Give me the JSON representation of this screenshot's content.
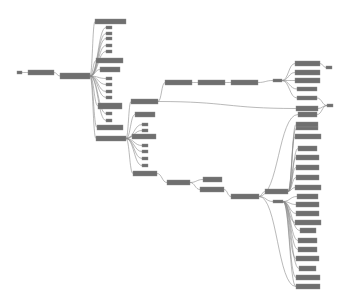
{
  "diagram": {
    "type": "tree-graph",
    "background": "#ffffff",
    "node_color": "#6f6f6f",
    "edge_color": "#8a8a8a",
    "nodes": [
      {
        "id": "n0",
        "x": 17,
        "y": 71,
        "w": 5,
        "h": 3,
        "label": ""
      },
      {
        "id": "n1",
        "x": 28,
        "y": 70,
        "w": 26,
        "h": 5,
        "label": ""
      },
      {
        "id": "n2",
        "x": 60,
        "y": 73,
        "w": 30,
        "h": 6,
        "label": ""
      },
      {
        "id": "a1",
        "x": 95,
        "y": 19,
        "w": 31,
        "h": 5,
        "label": ""
      },
      {
        "id": "a2",
        "x": 106,
        "y": 26,
        "w": 6,
        "h": 3,
        "label": ""
      },
      {
        "id": "a3",
        "x": 106,
        "y": 32,
        "w": 6,
        "h": 3,
        "label": ""
      },
      {
        "id": "a4",
        "x": 106,
        "y": 37,
        "w": 6,
        "h": 3,
        "label": ""
      },
      {
        "id": "a5",
        "x": 106,
        "y": 44,
        "w": 6,
        "h": 3,
        "label": ""
      },
      {
        "id": "a6",
        "x": 106,
        "y": 50,
        "w": 6,
        "h": 3,
        "label": ""
      },
      {
        "id": "a7",
        "x": 96,
        "y": 58,
        "w": 27,
        "h": 5,
        "label": ""
      },
      {
        "id": "a8",
        "x": 100,
        "y": 67,
        "w": 20,
        "h": 5,
        "label": ""
      },
      {
        "id": "a9",
        "x": 106,
        "y": 77,
        "w": 6,
        "h": 3,
        "label": ""
      },
      {
        "id": "a10",
        "x": 106,
        "y": 83,
        "w": 6,
        "h": 3,
        "label": ""
      },
      {
        "id": "a11",
        "x": 106,
        "y": 90,
        "w": 6,
        "h": 3,
        "label": ""
      },
      {
        "id": "a12",
        "x": 106,
        "y": 96,
        "w": 6,
        "h": 3,
        "label": ""
      },
      {
        "id": "a13",
        "x": 98,
        "y": 103,
        "w": 24,
        "h": 6,
        "label": ""
      },
      {
        "id": "a14",
        "x": 106,
        "y": 112,
        "w": 6,
        "h": 3,
        "label": ""
      },
      {
        "id": "a15",
        "x": 106,
        "y": 119,
        "w": 6,
        "h": 3,
        "label": ""
      },
      {
        "id": "a16",
        "x": 97,
        "y": 125,
        "w": 26,
        "h": 5,
        "label": ""
      },
      {
        "id": "h2",
        "x": 96,
        "y": 136,
        "w": 30,
        "h": 5,
        "label": ""
      },
      {
        "id": "b1",
        "x": 131,
        "y": 99,
        "w": 27,
        "h": 5,
        "label": ""
      },
      {
        "id": "b2",
        "x": 135,
        "y": 112,
        "w": 20,
        "h": 5,
        "label": ""
      },
      {
        "id": "b3",
        "x": 142,
        "y": 123,
        "w": 6,
        "h": 3,
        "label": ""
      },
      {
        "id": "b4",
        "x": 142,
        "y": 129,
        "w": 6,
        "h": 3,
        "label": ""
      },
      {
        "id": "b5",
        "x": 132,
        "y": 134,
        "w": 24,
        "h": 5,
        "label": ""
      },
      {
        "id": "b6",
        "x": 142,
        "y": 144,
        "w": 6,
        "h": 3,
        "label": ""
      },
      {
        "id": "b7",
        "x": 142,
        "y": 150,
        "w": 6,
        "h": 3,
        "label": ""
      },
      {
        "id": "b8",
        "x": 142,
        "y": 157,
        "w": 6,
        "h": 3,
        "label": ""
      },
      {
        "id": "b9",
        "x": 142,
        "y": 164,
        "w": 6,
        "h": 3,
        "label": ""
      },
      {
        "id": "b10",
        "x": 133,
        "y": 171,
        "w": 24,
        "h": 5,
        "label": ""
      },
      {
        "id": "c1",
        "x": 165,
        "y": 80,
        "w": 27,
        "h": 5,
        "label": ""
      },
      {
        "id": "c2",
        "x": 198,
        "y": 80,
        "w": 27,
        "h": 5,
        "label": ""
      },
      {
        "id": "c3",
        "x": 231,
        "y": 80,
        "w": 27,
        "h": 5,
        "label": ""
      },
      {
        "id": "c4",
        "x": 273,
        "y": 79,
        "w": 9,
        "h": 3,
        "label": ""
      },
      {
        "id": "d1",
        "x": 167,
        "y": 180,
        "w": 23,
        "h": 5,
        "label": ""
      },
      {
        "id": "d2",
        "x": 203,
        "y": 177,
        "w": 19,
        "h": 5,
        "label": ""
      },
      {
        "id": "d3",
        "x": 200,
        "y": 187,
        "w": 24,
        "h": 5,
        "label": ""
      },
      {
        "id": "d4",
        "x": 231,
        "y": 194,
        "w": 28,
        "h": 5,
        "label": ""
      },
      {
        "id": "h3",
        "x": 265,
        "y": 189,
        "w": 23,
        "h": 5,
        "label": ""
      },
      {
        "id": "h3s",
        "x": 273,
        "y": 200,
        "w": 10,
        "h": 3,
        "label": ""
      },
      {
        "id": "r1",
        "x": 295,
        "y": 61,
        "w": 25,
        "h": 5,
        "label": ""
      },
      {
        "id": "r2",
        "x": 295,
        "y": 70,
        "w": 25,
        "h": 5,
        "label": ""
      },
      {
        "id": "r3",
        "x": 295,
        "y": 78,
        "w": 25,
        "h": 5,
        "label": ""
      },
      {
        "id": "r4",
        "x": 297,
        "y": 87,
        "w": 20,
        "h": 4,
        "label": ""
      },
      {
        "id": "r5",
        "x": 297,
        "y": 96,
        "w": 20,
        "h": 4,
        "label": ""
      },
      {
        "id": "r6",
        "x": 296,
        "y": 106,
        "w": 22,
        "h": 5,
        "label": ""
      },
      {
        "id": "r7",
        "x": 298,
        "y": 112,
        "w": 19,
        "h": 5,
        "label": ""
      },
      {
        "id": "r8",
        "x": 296,
        "y": 122,
        "w": 22,
        "h": 5,
        "label": ""
      },
      {
        "id": "r9",
        "x": 296,
        "y": 127,
        "w": 22,
        "h": 3,
        "label": ""
      },
      {
        "id": "r10",
        "x": 295,
        "y": 134,
        "w": 26,
        "h": 5,
        "label": ""
      },
      {
        "id": "r11",
        "x": 298,
        "y": 146,
        "w": 19,
        "h": 5,
        "label": ""
      },
      {
        "id": "r12",
        "x": 296,
        "y": 155,
        "w": 23,
        "h": 5,
        "label": ""
      },
      {
        "id": "r13",
        "x": 296,
        "y": 165,
        "w": 23,
        "h": 5,
        "label": ""
      },
      {
        "id": "r14",
        "x": 296,
        "y": 175,
        "w": 23,
        "h": 5,
        "label": ""
      },
      {
        "id": "r15",
        "x": 295,
        "y": 185,
        "w": 26,
        "h": 5,
        "label": ""
      },
      {
        "id": "r16",
        "x": 297,
        "y": 194,
        "w": 21,
        "h": 5,
        "label": ""
      },
      {
        "id": "r17",
        "x": 296,
        "y": 202,
        "w": 23,
        "h": 5,
        "label": ""
      },
      {
        "id": "r18",
        "x": 296,
        "y": 211,
        "w": 23,
        "h": 5,
        "label": ""
      },
      {
        "id": "r19",
        "x": 295,
        "y": 220,
        "w": 26,
        "h": 5,
        "label": ""
      },
      {
        "id": "r20",
        "x": 300,
        "y": 228,
        "w": 16,
        "h": 5,
        "label": ""
      },
      {
        "id": "r21",
        "x": 298,
        "y": 238,
        "w": 19,
        "h": 5,
        "label": ""
      },
      {
        "id": "r22",
        "x": 298,
        "y": 247,
        "w": 19,
        "h": 5,
        "label": ""
      },
      {
        "id": "r23",
        "x": 296,
        "y": 256,
        "w": 23,
        "h": 5,
        "label": ""
      },
      {
        "id": "r24",
        "x": 299,
        "y": 266,
        "w": 17,
        "h": 5,
        "label": ""
      },
      {
        "id": "r25",
        "x": 296,
        "y": 275,
        "w": 24,
        "h": 5,
        "label": ""
      },
      {
        "id": "r26",
        "x": 296,
        "y": 284,
        "w": 24,
        "h": 5,
        "label": ""
      },
      {
        "id": "s1",
        "x": 326,
        "y": 66,
        "w": 6,
        "h": 3,
        "label": ""
      },
      {
        "id": "s2",
        "x": 327,
        "y": 104,
        "w": 6,
        "h": 3,
        "label": ""
      }
    ],
    "edges": [
      [
        "n0",
        "n1"
      ],
      [
        "n1",
        "n2"
      ],
      [
        "n2",
        "a1"
      ],
      [
        "n2",
        "a2"
      ],
      [
        "n2",
        "a3"
      ],
      [
        "n2",
        "a4"
      ],
      [
        "n2",
        "a5"
      ],
      [
        "n2",
        "a6"
      ],
      [
        "n2",
        "a7"
      ],
      [
        "n2",
        "a8"
      ],
      [
        "n2",
        "a9"
      ],
      [
        "n2",
        "a10"
      ],
      [
        "n2",
        "a11"
      ],
      [
        "n2",
        "a12"
      ],
      [
        "n2",
        "a13"
      ],
      [
        "n2",
        "a14"
      ],
      [
        "n2",
        "a15"
      ],
      [
        "n2",
        "a16"
      ],
      [
        "n2",
        "h2"
      ],
      [
        "h2",
        "b1"
      ],
      [
        "h2",
        "b2"
      ],
      [
        "h2",
        "b3"
      ],
      [
        "h2",
        "b4"
      ],
      [
        "h2",
        "b5"
      ],
      [
        "h2",
        "b6"
      ],
      [
        "h2",
        "b7"
      ],
      [
        "h2",
        "b8"
      ],
      [
        "h2",
        "b9"
      ],
      [
        "h2",
        "b10"
      ],
      [
        "b1",
        "c1"
      ],
      [
        "c1",
        "c2"
      ],
      [
        "c2",
        "c3"
      ],
      [
        "c3",
        "c4"
      ],
      [
        "c4",
        "r1"
      ],
      [
        "c4",
        "r2"
      ],
      [
        "c4",
        "r3"
      ],
      [
        "c4",
        "r4"
      ],
      [
        "c4",
        "r5"
      ],
      [
        "r1",
        "s1"
      ],
      [
        "r5",
        "s2"
      ],
      [
        "r6",
        "s2"
      ],
      [
        "r7",
        "s2"
      ],
      [
        "b1",
        "r6"
      ],
      [
        "b10",
        "d1"
      ],
      [
        "d1",
        "d2"
      ],
      [
        "d1",
        "d3"
      ],
      [
        "d3",
        "d4"
      ],
      [
        "d4",
        "h3"
      ],
      [
        "d4",
        "h3s"
      ],
      [
        "d4",
        "r7"
      ],
      [
        "d4",
        "r26"
      ],
      [
        "h3",
        "r8"
      ],
      [
        "h3",
        "r9"
      ],
      [
        "h3",
        "r10"
      ],
      [
        "h3",
        "r11"
      ],
      [
        "h3",
        "r12"
      ],
      [
        "h3",
        "r13"
      ],
      [
        "h3",
        "r14"
      ],
      [
        "h3",
        "r15"
      ],
      [
        "h3s",
        "r16"
      ],
      [
        "h3s",
        "r17"
      ],
      [
        "h3s",
        "r18"
      ],
      [
        "h3s",
        "r19"
      ],
      [
        "h3s",
        "r20"
      ],
      [
        "h3s",
        "r21"
      ],
      [
        "h3s",
        "r22"
      ],
      [
        "h3s",
        "r23"
      ],
      [
        "h3s",
        "r24"
      ],
      [
        "h3s",
        "r25"
      ],
      [
        "h3s",
        "r26"
      ]
    ]
  }
}
